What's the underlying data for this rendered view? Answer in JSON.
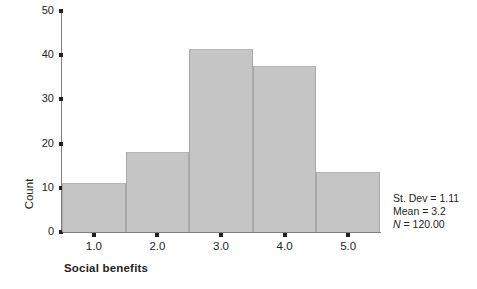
{
  "chart_data": {
    "type": "bar",
    "title": "",
    "subtitle": "",
    "xlabel": "Social benefits",
    "ylabel": "Count",
    "categories": [
      "1.0",
      "2.0",
      "3.0",
      "4.0",
      "5.0"
    ],
    "values": [
      11,
      18,
      41.5,
      37.5,
      13.5
    ],
    "xtick_labels": [
      "1.0",
      "2.0",
      "3.0",
      "4.0",
      "5.0"
    ],
    "ytick_labels": [
      "0",
      "10",
      "20",
      "30",
      "40",
      "50"
    ],
    "ytick_values": [
      0,
      10,
      20,
      30,
      40,
      50
    ],
    "ylim": [
      0,
      50
    ],
    "xlim": [
      0.5,
      5.5
    ],
    "grid": false,
    "legend": null,
    "bar_color": "#c5c5c5",
    "axis_color": "#808080",
    "text_color": "#231f20",
    "annotations": [
      "St. Dev = 1.11",
      "Mean = 3.2",
      "N = 120.00"
    ]
  },
  "stats": {
    "stdev_label": "St. Dev = 1.11",
    "mean_label": "Mean = 3.2",
    "n_symbol": "N",
    "n_value": " = 120.00"
  }
}
